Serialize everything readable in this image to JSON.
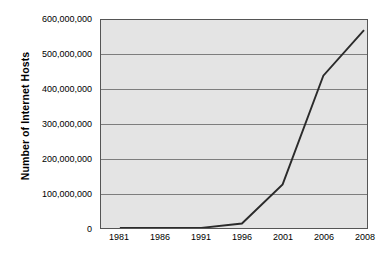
{
  "chart_data": {
    "type": "line",
    "title": "",
    "xlabel": "",
    "ylabel": "Number of Internet Hosts",
    "categories": [
      "1981",
      "1986",
      "1991",
      "1996",
      "2001",
      "2006",
      "2008"
    ],
    "values": [
      213,
      5089,
      376000,
      12881000,
      125888000,
      439286000,
      570937000
    ],
    "series": [
      {
        "name": "Number of Internet Hosts",
        "values": [
          213,
          5089,
          376000,
          12881000,
          125888000,
          439286000,
          570937000
        ]
      }
    ],
    "ylim": [
      0,
      600000000
    ],
    "yticks": [
      0,
      100000000,
      200000000,
      300000000,
      400000000,
      500000000,
      600000000
    ],
    "ytick_labels": [
      "0",
      "100,000,000",
      "200,000,000",
      "300,000,000",
      "400,000,000",
      "500,000,000",
      "600,000,000"
    ],
    "xtick_labels": [
      "1981",
      "1986",
      "1991",
      "1996",
      "2001",
      "2006",
      "2008"
    ],
    "grid": "horizontal",
    "legend": "none",
    "colors": {
      "plot_background": "#e4e4e4",
      "gridline": "#7d7d7d",
      "frame": "#555555",
      "line": "#2b2b2b",
      "text": "#000000",
      "figure_background": "#ffffff"
    }
  }
}
